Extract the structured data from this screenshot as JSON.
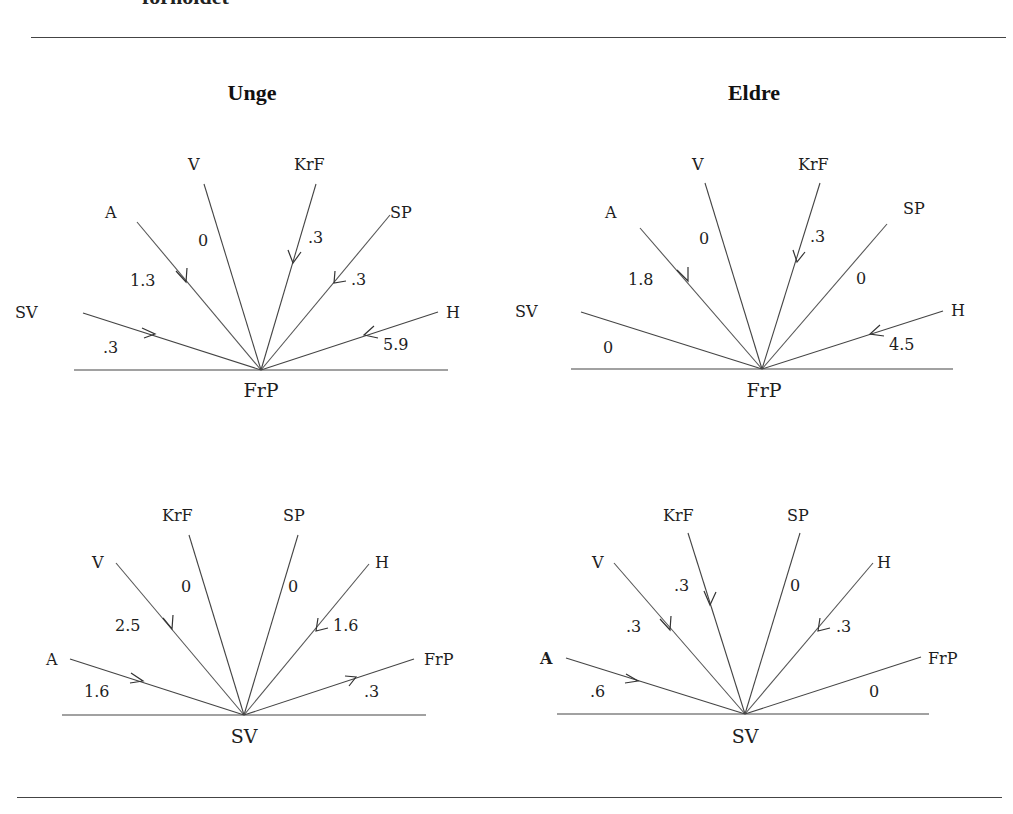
{
  "page": {
    "caption_tail": "forholdet",
    "columns": [
      {
        "heading": "Unge"
      },
      {
        "heading": "Eldre"
      }
    ]
  },
  "diagrams": [
    {
      "group": "Unge",
      "center": "FrP",
      "spokes": [
        {
          "party": "SV",
          "value": ".3",
          "arrow": "toward-center"
        },
        {
          "party": "A",
          "value": "1.3",
          "arrow": "toward-center"
        },
        {
          "party": "V",
          "value": "0",
          "arrow": "none"
        },
        {
          "party": "KrF",
          "value": ".3",
          "arrow": "toward-center"
        },
        {
          "party": "SP",
          "value": ".3",
          "arrow": "toward-center"
        },
        {
          "party": "H",
          "value": "5.9",
          "arrow": "toward-center"
        }
      ]
    },
    {
      "group": "Eldre",
      "center": "FrP",
      "spokes": [
        {
          "party": "SV",
          "value": "0",
          "arrow": "none"
        },
        {
          "party": "A",
          "value": "1.8",
          "arrow": "toward-center"
        },
        {
          "party": "V",
          "value": "0",
          "arrow": "none"
        },
        {
          "party": "KrF",
          "value": ".3",
          "arrow": "toward-center"
        },
        {
          "party": "SP",
          "value": "0",
          "arrow": "none"
        },
        {
          "party": "H",
          "value": "4.5",
          "arrow": "toward-center"
        }
      ]
    },
    {
      "group": "Unge",
      "center": "SV",
      "spokes": [
        {
          "party": "A",
          "value": "1.6",
          "arrow": "toward-center"
        },
        {
          "party": "V",
          "value": "2.5",
          "arrow": "toward-center"
        },
        {
          "party": "KrF",
          "value": "0",
          "arrow": "none"
        },
        {
          "party": "SP",
          "value": "0",
          "arrow": "none"
        },
        {
          "party": "H",
          "value": "1.6",
          "arrow": "toward-center"
        },
        {
          "party": "FrP",
          "value": ".3",
          "arrow": "away-from-center"
        }
      ]
    },
    {
      "group": "Eldre",
      "center": "SV",
      "spokes": [
        {
          "party": "A",
          "value": ".6",
          "arrow": "toward-center"
        },
        {
          "party": "V",
          "value": ".3",
          "arrow": "toward-center"
        },
        {
          "party": "KrF",
          "value": ".3",
          "arrow": "toward-center"
        },
        {
          "party": "SP",
          "value": "0",
          "arrow": "none"
        },
        {
          "party": "H",
          "value": ".3",
          "arrow": "toward-center"
        },
        {
          "party": "FrP",
          "value": "0",
          "arrow": "none"
        }
      ]
    }
  ]
}
